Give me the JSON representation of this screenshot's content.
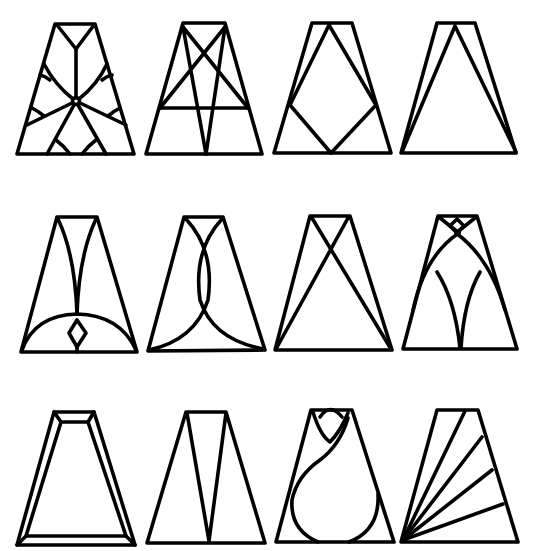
{
  "colors": {
    "line": "#000000",
    "background": "#ffffff"
  },
  "designs": [
    {
      "id": 1,
      "row": 1,
      "col": 1,
      "name": "Star flower with central ring"
    },
    {
      "id": 2,
      "row": 1,
      "col": 2,
      "name": "Crossed diagonals with horizontal bar"
    },
    {
      "id": 3,
      "row": 1,
      "col": 3,
      "name": "Diamond inset"
    },
    {
      "id": 4,
      "row": 1,
      "col": 4,
      "name": "Inner triangle"
    },
    {
      "id": 5,
      "row": 2,
      "col": 1,
      "name": "Arch with small diamond"
    },
    {
      "id": 6,
      "row": 2,
      "col": 2,
      "name": "Interlaced arcs"
    },
    {
      "id": 7,
      "row": 2,
      "col": 3,
      "name": "X cross"
    },
    {
      "id": 8,
      "row": 2,
      "col": 4,
      "name": "Gothic arches"
    },
    {
      "id": 9,
      "row": 3,
      "col": 1,
      "name": "Double border frame"
    },
    {
      "id": 10,
      "row": 3,
      "col": 2,
      "name": "Inverted V"
    },
    {
      "id": 11,
      "row": 3,
      "col": 3,
      "name": "Tulip bud"
    },
    {
      "id": 12,
      "row": 3,
      "col": 4,
      "name": "Fan rays"
    }
  ]
}
